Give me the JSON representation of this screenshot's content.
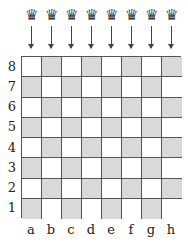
{
  "queens": [
    {
      "file": "a",
      "glyph": "♛"
    },
    {
      "file": "b",
      "glyph": "♛"
    },
    {
      "file": "c",
      "glyph": "♛"
    },
    {
      "file": "d",
      "glyph": "♛"
    },
    {
      "file": "e",
      "glyph": "♛"
    },
    {
      "file": "f",
      "glyph": "♛"
    },
    {
      "file": "g",
      "glyph": "♛"
    },
    {
      "file": "h",
      "glyph": "♛"
    }
  ],
  "board": {
    "ranks": [
      "8",
      "7",
      "6",
      "5",
      "4",
      "3",
      "2",
      "1"
    ],
    "files": [
      "a",
      "b",
      "c",
      "d",
      "e",
      "f",
      "g",
      "h"
    ],
    "colors": {
      "dark": "#d9d9d9",
      "light": "#ffffff",
      "grid": "#555555"
    }
  }
}
